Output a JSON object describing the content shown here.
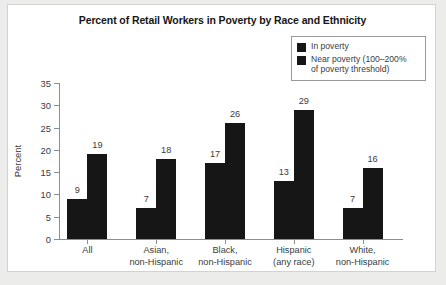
{
  "chart_data": {
    "type": "bar",
    "title": "Percent of Retail Workers in Poverty by Race and Ethnicity",
    "xlabel": "",
    "ylabel": "Percent",
    "ylim": [
      0,
      35
    ],
    "yticks": [
      0,
      5,
      10,
      15,
      20,
      25,
      30,
      35
    ],
    "grid": false,
    "legend_position": "top-right",
    "categories": [
      "All",
      "Asian,\nnon-Hispanic",
      "Black,\nnon-Hispanic",
      "Hispanic\n(any race)",
      "White,\nnon-Hispanic"
    ],
    "category_lines": [
      [
        "All",
        ""
      ],
      [
        "Asian,",
        "non-Hispanic"
      ],
      [
        "Black,",
        "non-Hispanic"
      ],
      [
        "Hispanic",
        "(any race)"
      ],
      [
        "White,",
        "non-Hispanic"
      ]
    ],
    "series": [
      {
        "name": "In poverty",
        "values": [
          9,
          7,
          17,
          13,
          7
        ],
        "color": "#161616"
      },
      {
        "name": "Near poverty (100–200% of poverty threshold)",
        "values": [
          19,
          18,
          26,
          29,
          16
        ],
        "color": "#161616"
      }
    ],
    "data_labels": [
      [
        9,
        19
      ],
      [
        7,
        18
      ],
      [
        17,
        26
      ],
      [
        13,
        29
      ],
      [
        7,
        16
      ]
    ]
  },
  "legend": {
    "entries": [
      {
        "label": "In poverty"
      },
      {
        "label": "Near poverty (100–200%"
      },
      {
        "label": "of poverty threshold)"
      }
    ]
  },
  "colors": {
    "bar": "#161616",
    "axis": "#8e8e8e",
    "text": "#3b3b3b",
    "title": "#161616",
    "panel": "#ffffff",
    "page": "#ececeb"
  }
}
